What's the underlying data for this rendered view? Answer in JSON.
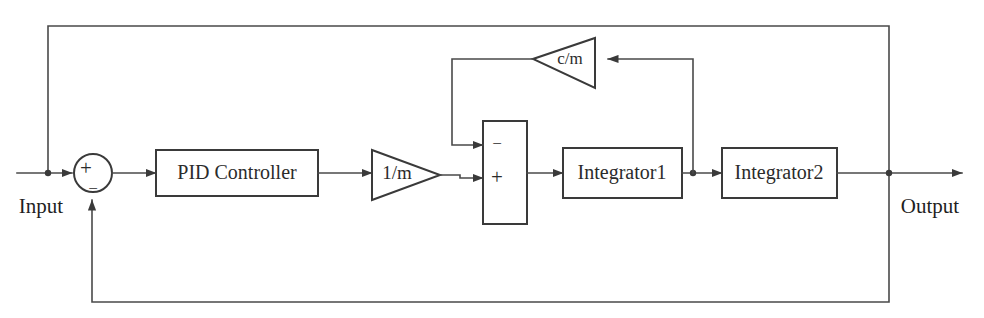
{
  "diagram": {
    "type": "control-block-diagram",
    "canvas": {
      "width": 984,
      "height": 318
    },
    "stroke_color": "#3a3a3a",
    "background_color": "#ffffff",
    "ports": {
      "input_label": "Input",
      "output_label": "Output"
    },
    "blocks": [
      {
        "id": "sum-input",
        "kind": "summing-junction-circle",
        "label": "",
        "signs": {
          "top": "+",
          "bottom": "−"
        },
        "cx": 93,
        "cy": 173,
        "r": 19
      },
      {
        "id": "pid-controller",
        "kind": "rect",
        "label": "PID Controller",
        "x": 156,
        "y": 150,
        "w": 162,
        "h": 46
      },
      {
        "id": "gain-inv-m",
        "kind": "triangle-right",
        "label": "1/m",
        "x": 372,
        "y": 150,
        "w": 68,
        "h": 50
      },
      {
        "id": "sum-plant",
        "kind": "summing-junction-rect",
        "label": "",
        "signs": {
          "upper": "−",
          "lower": "+"
        },
        "x": 483,
        "y": 121,
        "w": 44,
        "h": 103
      },
      {
        "id": "integrator-1",
        "kind": "rect",
        "label": "Integrator1",
        "x": 563,
        "y": 148,
        "w": 119,
        "h": 50
      },
      {
        "id": "integrator-2",
        "kind": "rect",
        "label": "Integrator2",
        "x": 722,
        "y": 148,
        "w": 115,
        "h": 50
      },
      {
        "id": "gain-c-over-m",
        "kind": "triangle-left",
        "label": "c/m",
        "x": 533,
        "y": 38,
        "w": 62,
        "h": 50
      }
    ],
    "signals": [
      {
        "id": "input-to-sum",
        "from": "Input",
        "to": "sum-input"
      },
      {
        "id": "sum-to-pid",
        "from": "sum-input",
        "to": "pid-controller"
      },
      {
        "id": "pid-to-gain",
        "from": "pid-controller",
        "to": "gain-inv-m"
      },
      {
        "id": "gain-to-sum-plus",
        "from": "gain-inv-m",
        "to": "sum-plant"
      },
      {
        "id": "sum-to-integrator1",
        "from": "sum-plant",
        "to": "integrator-1"
      },
      {
        "id": "integrator1-to-integrator2",
        "from": "integrator-1",
        "to": "integrator-2"
      },
      {
        "id": "integrator2-to-output",
        "from": "integrator-2",
        "to": "Output"
      },
      {
        "id": "velocity-tap-to-damping",
        "from": "integrator-1",
        "to": "gain-c-over-m"
      },
      {
        "id": "damping-to-sum-minus",
        "from": "gain-c-over-m",
        "to": "sum-plant"
      },
      {
        "id": "output-feedback-bottom",
        "from": "Output",
        "to": "sum-input"
      },
      {
        "id": "output-feedforward-top",
        "from": "Output",
        "to": "input-line"
      }
    ],
    "junctions": [
      {
        "id": "junction-input-line",
        "x": 48,
        "y": 173
      },
      {
        "id": "junction-velocity-tap",
        "x": 693,
        "y": 173
      },
      {
        "id": "junction-output-tap",
        "x": 889,
        "y": 173
      }
    ]
  }
}
